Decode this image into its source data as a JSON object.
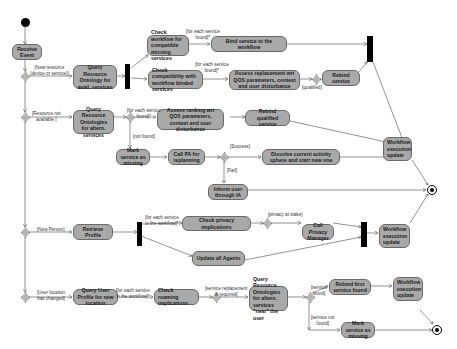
{
  "diagram": {
    "type": "UML activity diagram",
    "nodes": {
      "receive_event": "Receive Event",
      "query_resource_ontology_avail": "Query Resource Ontology for avail. services",
      "check_workflow_compatible": "Check workflow for compatible missing services",
      "bind_service": "Bind service to the workflow",
      "check_compatibility_bound": "Check compatibility with workflow binded services",
      "assess_replacement": "Assess replacement wrt QOS parameters, context and user disturbance",
      "rebind_service": "Rebind service",
      "query_resource_ontologies_altern": "Query Resource Ontologies for altern. services",
      "assess_ranking": "Assess ranking wrt QOS parameters, context and user disturbance",
      "rebind_qualified": "Rebind qualified service",
      "mark_missing_1": "Mark service as missing",
      "call_pa_replanning": "Call PA for replanning",
      "dissolve_sphere": "Dissolve current activity sphere and start new one",
      "inform_user": "Inform user through IA",
      "workflow_update_1": "Workflow execution update",
      "retrieve_profile": "Retrieve Profile",
      "check_privacy": "Check privacy implications",
      "call_privacy_manager": "Call Privacy Manager",
      "update_agents": "Update all Agents",
      "workflow_update_2": "Workflow execution update",
      "query_user_profile": "Query User Profile for new location",
      "check_roaming": "Check roaming implications",
      "query_resource_ontologies_near": "Query Resource Ontologies for altern. services \"near\" the user",
      "rebind_first_found": "Rebind first service found",
      "workflow_update_3": "Workflow execution update",
      "mark_missing_2": "Mark service as missing"
    },
    "guards": {
      "new_resource": "[New resource\n(device or service)]",
      "for_each_found_1": "[for each service\nfound]*",
      "for_each_found_2": "[for each service\nfound]*",
      "qualified": "[qualified]",
      "resource_not_available": "[Resource not\navailable ]",
      "for_each_found_3": "[for each service\nfound]*",
      "not_found": "[not found]",
      "success": "[Success]",
      "fail": "[Fail]",
      "new_person": "[New Person]",
      "for_each_workflow_1": "[for each service\nin the workflow]*",
      "privacy_at_stake": "[privacy at stake]",
      "user_location_changed": "[User location\nhas changed]",
      "for_each_workflow_2": "[for each service\nin the workflow]*",
      "replacement_required": "[service replacement\nis required]",
      "service_found": "[service\nfound]",
      "service_not_found": "[service not\nfound]"
    }
  }
}
